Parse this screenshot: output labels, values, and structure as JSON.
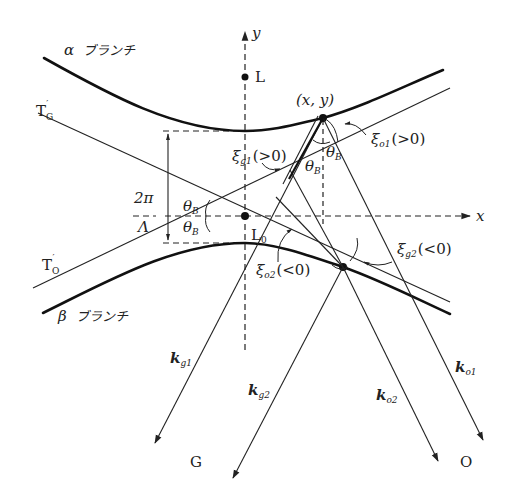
{
  "figure": {
    "colors": {
      "ink": "#222222",
      "background": "#ffffff"
    }
  },
  "axes": {
    "x_label": "x",
    "y_label": "y"
  },
  "points": {
    "L": "L",
    "L0": "L",
    "L0_sub": "0",
    "tie_point_label": "(x, y)"
  },
  "branches": {
    "alpha": {
      "symbol": "α",
      "name": "ブランチ"
    },
    "beta": {
      "symbol": "β",
      "name": "ブランチ"
    }
  },
  "asymptotes": {
    "TG": {
      "main": "T",
      "sub": "G",
      "prime": "′"
    },
    "TO": {
      "main": "T",
      "sub": "O",
      "prime": "′"
    }
  },
  "gap": {
    "numerator": "2π",
    "denominator": "Λ"
  },
  "angles": {
    "theta_B": "θ",
    "theta_B_sub": "B"
  },
  "deviations": {
    "xi_g1": {
      "sym": "ξ",
      "sub": "g1",
      "cond": "(>0)"
    },
    "xi_o1": {
      "sym": "ξ",
      "sub": "o1",
      "cond": "(>0)"
    },
    "xi_g2": {
      "sym": "ξ",
      "sub": "g2",
      "cond": "(<0)"
    },
    "xi_o2": {
      "sym": "ξ",
      "sub": "o2",
      "cond": "(<0)"
    }
  },
  "wave_vectors": {
    "kg1": {
      "sym": "k",
      "sub": "g1"
    },
    "kg2": {
      "sym": "k",
      "sub": "g2"
    },
    "ko1": {
      "sym": "k",
      "sub": "o1"
    },
    "ko2": {
      "sym": "k",
      "sub": "o2"
    }
  },
  "reciprocal_points": {
    "G": "G",
    "O": "O"
  }
}
